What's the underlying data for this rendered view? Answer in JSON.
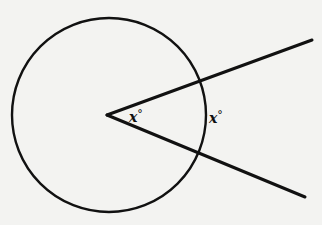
{
  "diagram": {
    "type": "geometry",
    "colors": {
      "stroke": "#111111",
      "background": "#f3f3f1"
    },
    "circle": {
      "cx": 109,
      "cy": 115,
      "r": 97
    },
    "vertex": {
      "x": 107,
      "y": 115
    },
    "rays": [
      {
        "name": "upper-ray",
        "x2": 312,
        "y2": 40
      },
      {
        "name": "lower-ray",
        "x2": 305,
        "y2": 197
      }
    ],
    "labels": {
      "central_angle": {
        "var": "x",
        "unit": "°"
      },
      "arc": {
        "var": "x",
        "unit": "°"
      }
    }
  }
}
